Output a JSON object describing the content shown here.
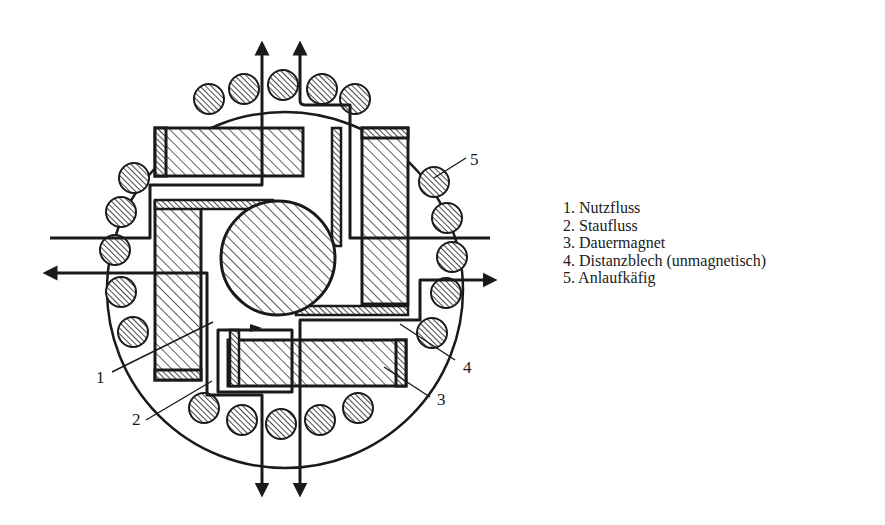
{
  "diagram": {
    "callouts": [
      {
        "id": "1",
        "label": "1"
      },
      {
        "id": "2",
        "label": "2"
      },
      {
        "id": "3",
        "label": "3"
      },
      {
        "id": "4",
        "label": "4"
      },
      {
        "id": "5",
        "label": "5"
      }
    ]
  },
  "legend": {
    "items": [
      {
        "label": "1. Nutzfluss"
      },
      {
        "label": "2. Staufluss"
      },
      {
        "label": "3. Dauermagnet"
      },
      {
        "label": "4. Distanzblech (unmagnetisch)"
      },
      {
        "label": "5. Anlaufkäfig"
      }
    ]
  },
  "colors": {
    "ink": "#1a1a1a",
    "bar_fill": "#8c8c8c",
    "background": "#ffffff"
  }
}
